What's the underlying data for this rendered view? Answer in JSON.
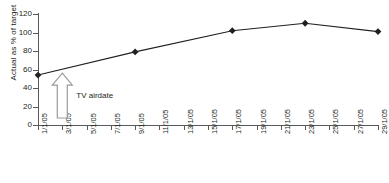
{
  "chart_data": {
    "type": "line",
    "title": "",
    "xlabel": "",
    "ylabel": "Actual as % of target",
    "ylim": [
      0,
      120
    ],
    "ytick_values": [
      0,
      20,
      40,
      60,
      80,
      100,
      120
    ],
    "ytick_labels": [
      "0",
      "20",
      "40",
      "60",
      "80",
      "100",
      "120"
    ],
    "grid": false,
    "legend": "none",
    "categories": [
      "1/1/05",
      "3/1/05",
      "5/1/05",
      "7/1/05",
      "9/1/05",
      "11/1/05",
      "13/1/05",
      "15/1/05",
      "17/1/05",
      "19/1/05",
      "21/1/05",
      "23/1/05",
      "25/1/05",
      "27/1/05",
      "29/1/05"
    ],
    "series": [
      {
        "name": "Actual as % of target",
        "marker": "diamond",
        "marker_color": "#231f20",
        "line_color": "#231f20",
        "points": [
          {
            "x": "1/1/05",
            "y": 54
          },
          {
            "x": "9/1/05",
            "y": 79
          },
          {
            "x": "17/1/05",
            "y": 102
          },
          {
            "x": "23/1/05",
            "y": 110
          },
          {
            "x": "29/1/05",
            "y": 101
          }
        ]
      }
    ],
    "annotations": [
      {
        "text": "TV airdate",
        "type": "up-arrow",
        "at_x": "3/1/05",
        "points_to_y": 56,
        "arrow_fill": "#ffffff",
        "arrow_stroke": "#9b9b9b"
      }
    ]
  },
  "axis": {
    "y_title": "Actual as % of target",
    "y_labels": [
      "120",
      "100",
      "80",
      "60",
      "40",
      "20",
      "0"
    ],
    "x_labels": [
      "1/1/05",
      "3/1/05",
      "5/1/05",
      "7/1/05",
      "9/1/05",
      "11/1/05",
      "13/1/05",
      "15/1/05",
      "17/1/05",
      "19/1/05",
      "21/1/05",
      "23/1/05",
      "25/1/05",
      "27/1/05",
      "29/1/05"
    ]
  },
  "annotation": {
    "tv_airdate_label": "TV airdate"
  },
  "colors": {
    "axis": "#58595b",
    "series": "#231f20",
    "arrow_stroke": "#9b9b9b",
    "arrow_fill": "#ffffff",
    "background": "#ffffff"
  }
}
